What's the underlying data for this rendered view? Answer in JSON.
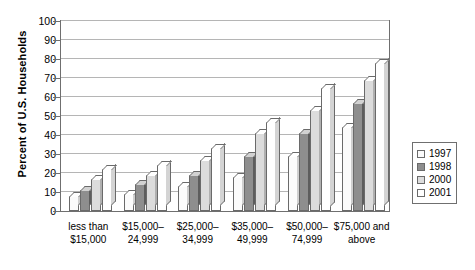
{
  "chart_data": {
    "type": "bar",
    "title": "",
    "xlabel": "",
    "ylabel": "Percent of U.S. Households",
    "ylim": [
      0,
      100
    ],
    "ytick_step": 10,
    "yticks": [
      "100",
      "90",
      "80",
      "70",
      "60",
      "50",
      "40",
      "30",
      "20",
      "10",
      "0"
    ],
    "grid": true,
    "legend_position": "right",
    "categories": [
      "less than\n$15,000",
      "$15,000–\n24,999",
      "$25,000–\n34,999",
      "$35,000–\n49,999",
      "$50,000–\n74,999",
      "$75,000 and\nabove"
    ],
    "category_labels": [
      {
        "line1": "less than",
        "line2": "$15,000"
      },
      {
        "line1": "$15,000–",
        "line2": "24,999"
      },
      {
        "line1": "$25,000–",
        "line2": "34,999"
      },
      {
        "line1": "$35,000–",
        "line2": "49,999"
      },
      {
        "line1": "$50,000–",
        "line2": "74,999"
      },
      {
        "line1": "$75,000 and",
        "line2": "above"
      }
    ],
    "series": [
      {
        "name": "1997",
        "color": "#fbfbfb",
        "values": [
          8,
          9,
          13,
          18,
          29,
          44
        ]
      },
      {
        "name": "1998",
        "color": "#8e8e8e",
        "values": [
          11,
          14,
          19,
          29,
          41,
          57
        ]
      },
      {
        "name": "2000",
        "color": "#dcdcdc",
        "values": [
          17,
          19,
          27,
          41,
          53,
          69
        ]
      },
      {
        "name": "2001",
        "color": "#ffffff",
        "values": [
          22,
          24,
          33,
          47,
          65,
          78
        ]
      }
    ]
  },
  "legend": {
    "items": [
      {
        "label": "1997"
      },
      {
        "label": "1998"
      },
      {
        "label": "2000"
      },
      {
        "label": "2001"
      }
    ]
  }
}
